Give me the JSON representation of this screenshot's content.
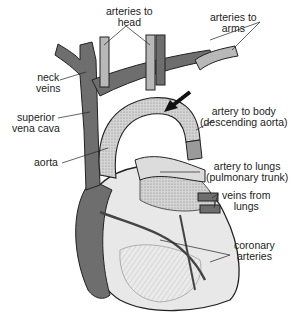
{
  "diagram": {
    "labels": {
      "arteries_to_head_1": "arteries to",
      "arteries_to_head_2": "head",
      "arteries_to_arms_1": "arteries to",
      "arteries_to_arms_2": "arms",
      "neck_veins_1": "neck",
      "neck_veins_2": "veins",
      "superior_vena_cava_1": "superior",
      "superior_vena_cava_2": "vena cava",
      "aorta": "aorta",
      "descending_aorta_1": "artery to body",
      "descending_aorta_2": "(descending aorta)",
      "pulmonary_trunk_1": "artery to lungs",
      "pulmonary_trunk_2": "(pulmonary trunk)",
      "veins_from_lungs_1": "veins from",
      "veins_from_lungs_2": "lungs",
      "coronary_arteries_1": "coronary",
      "coronary_arteries_2": "arteries"
    },
    "colors": {
      "vein_dark": "#6e6e6e",
      "artery_light": "#b8b8b8",
      "heart_fill": "#e6e6e6",
      "outline": "#222222"
    },
    "arrow": "pointer-arrow toward aortic arch"
  }
}
